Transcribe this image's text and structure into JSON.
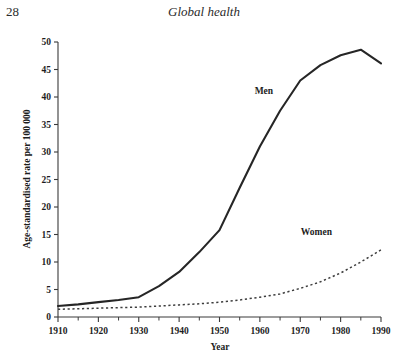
{
  "page": {
    "number": "28",
    "running_title": "Global health"
  },
  "chart_data": {
    "type": "line",
    "title": "",
    "xlabel": "Year",
    "ylabel": "Age-standardised rate per 100 000",
    "xlim": [
      1910,
      1990
    ],
    "ylim": [
      0,
      50
    ],
    "xticks": [
      1910,
      1920,
      1930,
      1940,
      1950,
      1960,
      1970,
      1980,
      1990
    ],
    "xtick_labels": [
      "1910",
      "1920",
      "1930",
      "1940",
      "1950",
      "1960",
      "1970",
      "1980",
      "1990"
    ],
    "x_minor_tick_step": 5,
    "yticks": [
      0,
      5,
      10,
      15,
      20,
      25,
      30,
      35,
      40,
      45,
      50
    ],
    "ytick_labels": [
      "0",
      "5",
      "10",
      "15",
      "20",
      "25",
      "30",
      "35",
      "40",
      "45",
      "50"
    ],
    "grid": false,
    "legend_position": "inline-annotations",
    "x": [
      1910,
      1915,
      1920,
      1925,
      1930,
      1935,
      1940,
      1945,
      1950,
      1955,
      1960,
      1965,
      1970,
      1975,
      1980,
      1985,
      1990
    ],
    "series": [
      {
        "name": "Men",
        "style": "solid",
        "color": "#262626",
        "label_x": 1961,
        "label_y": 40.5,
        "values": [
          2.0,
          2.3,
          2.7,
          3.1,
          3.6,
          5.6,
          8.2,
          11.8,
          15.8,
          23.5,
          31.0,
          37.5,
          43.0,
          45.8,
          47.6,
          48.6,
          46.1
        ]
      },
      {
        "name": "Women",
        "style": "dashed",
        "color": "#3d3d3d",
        "label_x": 1974,
        "label_y": 15.0,
        "values": [
          1.4,
          1.5,
          1.6,
          1.7,
          1.8,
          2.0,
          2.2,
          2.4,
          2.7,
          3.1,
          3.6,
          4.2,
          5.2,
          6.4,
          8.0,
          10.0,
          12.2
        ]
      }
    ]
  }
}
